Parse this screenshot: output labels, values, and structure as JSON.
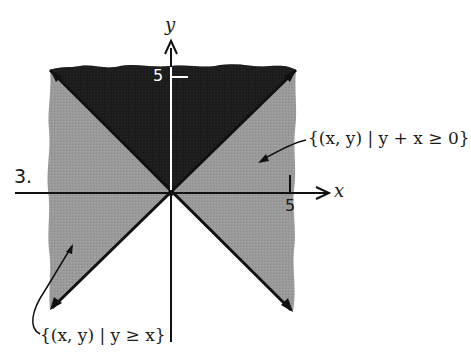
{
  "problem_number": "3.",
  "axes": {
    "x_label": "x",
    "y_label": "y",
    "x_tick_label": "5",
    "y_tick_label": "5"
  },
  "regions": {
    "upper_right_set": {
      "label": "{(x, y) | y + x ≥ 0}",
      "shade": "#9a9a9a"
    },
    "lower_left_set": {
      "label": "{(x, y) | y ≥ x}",
      "shade": "#9a9a9a"
    },
    "intersection": {
      "shade": "#1c1c1c"
    }
  },
  "colors": {
    "background": "#ffffff",
    "light_shade": "#9a9a9a",
    "dark_shade": "#1c1c1c",
    "line": "#111111"
  }
}
